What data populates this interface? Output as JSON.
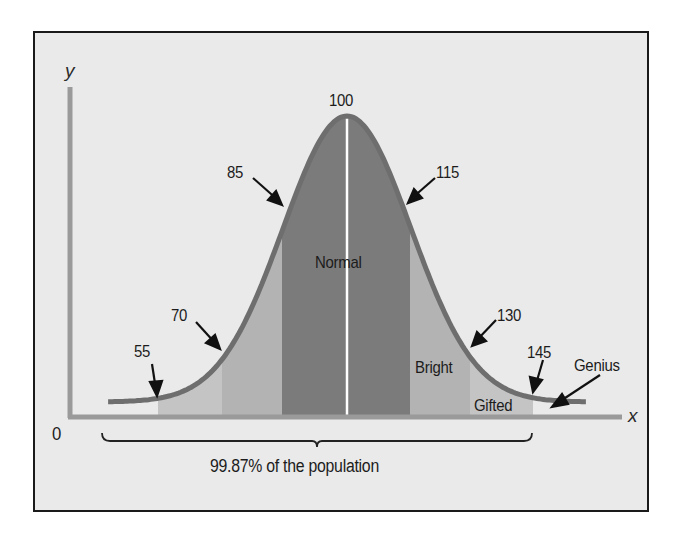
{
  "chart_data": {
    "type": "area",
    "title": "",
    "subtitle": "",
    "xlabel": "x",
    "ylabel": "y",
    "origin_label": "0",
    "distribution": {
      "mean": 100,
      "sd": 15
    },
    "markers": [
      55,
      70,
      85,
      100,
      115,
      130,
      145
    ],
    "bands": [
      {
        "from": 55,
        "to": 70,
        "shade": "light"
      },
      {
        "from": 70,
        "to": 85,
        "shade": "medium-light"
      },
      {
        "from": 85,
        "to": 115,
        "shade": "dark",
        "label": "Normal"
      },
      {
        "from": 115,
        "to": 130,
        "shade": "medium-light",
        "label": "Bright"
      },
      {
        "from": 130,
        "to": 145,
        "shade": "light",
        "label": "Gifted"
      },
      {
        "from": 145,
        "to": 160,
        "shade": "none",
        "label": "Genius"
      }
    ],
    "annotations": [
      {
        "text": "55",
        "points_to": 55
      },
      {
        "text": "70",
        "points_to": 70
      },
      {
        "text": "85",
        "points_to": 85
      },
      {
        "text": "100",
        "points_to": 100
      },
      {
        "text": "115",
        "points_to": 115
      },
      {
        "text": "130",
        "points_to": 130
      },
      {
        "text": "145",
        "points_to": 145
      },
      {
        "text": "Genius",
        "points_to": 150
      }
    ],
    "bracket": {
      "from": 55,
      "to": 145,
      "label": "99.87% of the population"
    },
    "grid": false,
    "legend": "none"
  },
  "labels": {
    "y_axis": "y",
    "x_axis": "x",
    "origin": "0",
    "peak": "100",
    "m85": "85",
    "m115": "115",
    "m70": "70",
    "m130": "130",
    "m55": "55",
    "m145": "145",
    "normal": "Normal",
    "bright": "Bright",
    "gifted": "Gifted",
    "genius": "Genius",
    "population": "99.87% of the population"
  },
  "colors": {
    "background": "#eaeaea",
    "curve": "#6e6e6e",
    "axis": "#9a9a9a",
    "band_dark": "#7a7a7a",
    "band_medium": "#b0b0b0",
    "band_light": "#c2c2c2",
    "mean_line": "#ffffff"
  }
}
